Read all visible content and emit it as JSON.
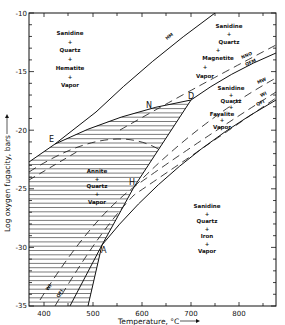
{
  "chart_data": {
    "type": "phase-diagram",
    "xlabel": "Temperature, °C",
    "ylabel": "Log oxygen fugacity, bars",
    "x_ticks": [
      "400",
      "500",
      "600",
      "700",
      "800"
    ],
    "y_ticks": [
      "-10",
      "-15",
      "-20",
      "-25",
      "-30",
      "-35"
    ],
    "xlim": [
      370,
      875
    ],
    "ylim": [
      -35,
      -10
    ],
    "fields": [
      {
        "name": "hematite-field",
        "lines": [
          "Sanidine",
          "+",
          "Quartz",
          "+",
          "Hematite",
          "+",
          "Vapor"
        ]
      },
      {
        "name": "magnetite-field",
        "lines": [
          "Sanidine",
          "+",
          "Quartz",
          "+",
          "Magnetite",
          "+",
          "Vapor"
        ]
      },
      {
        "name": "fayalite-field",
        "lines": [
          "Sanidine",
          "+",
          "Quartz",
          "+",
          "Fayalite",
          "+",
          "Vapor"
        ]
      },
      {
        "name": "annite-field",
        "lines": [
          "Annite",
          "+",
          "Quartz",
          "+",
          "Vapor"
        ]
      },
      {
        "name": "iron-field",
        "lines": [
          "Sanidine",
          "+",
          "Quartz",
          "+",
          "Iron",
          "+",
          "Vapor"
        ]
      }
    ],
    "buffer_curves": [
      "HM",
      "NNO",
      "QFM",
      "MW",
      "WI",
      "QFI"
    ],
    "points": [
      "D",
      "N",
      "E",
      "H",
      "A"
    ]
  },
  "labels": {
    "x_title": "Temperature, °C",
    "y_title": "Log oxygen fugacity, bars",
    "hm": "HM",
    "nno": "NNO",
    "qfm": "QFM",
    "mw": "MW",
    "wi": "WI",
    "qfi": "QFI",
    "wi_low": "WI",
    "qfi_low": "QFI"
  },
  "points": {
    "d": "D",
    "n": "N",
    "e": "E",
    "h": "H",
    "a": "A"
  },
  "fields": {
    "hematite": [
      "Sanidine",
      "+",
      "Quartz",
      "+",
      "Hematite",
      "+",
      "Vapor"
    ],
    "magnetite": [
      "Sanidine",
      "+",
      "Quartz",
      "+",
      "Magnetite",
      "+",
      "Vapor"
    ],
    "fayalite": [
      "Sanidine",
      "+",
      "Quartz",
      "+",
      "Fayalite",
      "+",
      "Vapor"
    ],
    "annite": [
      "Annite",
      "+",
      "Quartz",
      "+",
      "Vapor"
    ],
    "iron": [
      "Sanidine",
      "+",
      "Quartz",
      "+",
      "Iron",
      "+",
      "Vapor"
    ]
  },
  "ticks": {
    "x": [
      "400",
      "500",
      "600",
      "700",
      "800"
    ],
    "y": [
      "-10",
      "-15",
      "-20",
      "-25",
      "-30",
      "-35"
    ]
  }
}
